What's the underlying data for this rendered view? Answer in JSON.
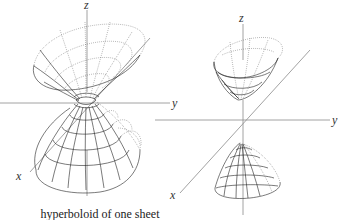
{
  "figures": [
    {
      "name": "hyperboloid-one-sheet",
      "caption": "hyperboloid of one sheet",
      "axes": {
        "x": "x",
        "y": "y",
        "z": "z"
      }
    },
    {
      "name": "hyperboloid-two-sheets",
      "caption": "",
      "axes": {
        "x": "x",
        "y": "y",
        "z": "z"
      }
    }
  ],
  "colors": {
    "mesh": "#222222",
    "axis": "#8a8a8a",
    "background": "#ffffff"
  }
}
